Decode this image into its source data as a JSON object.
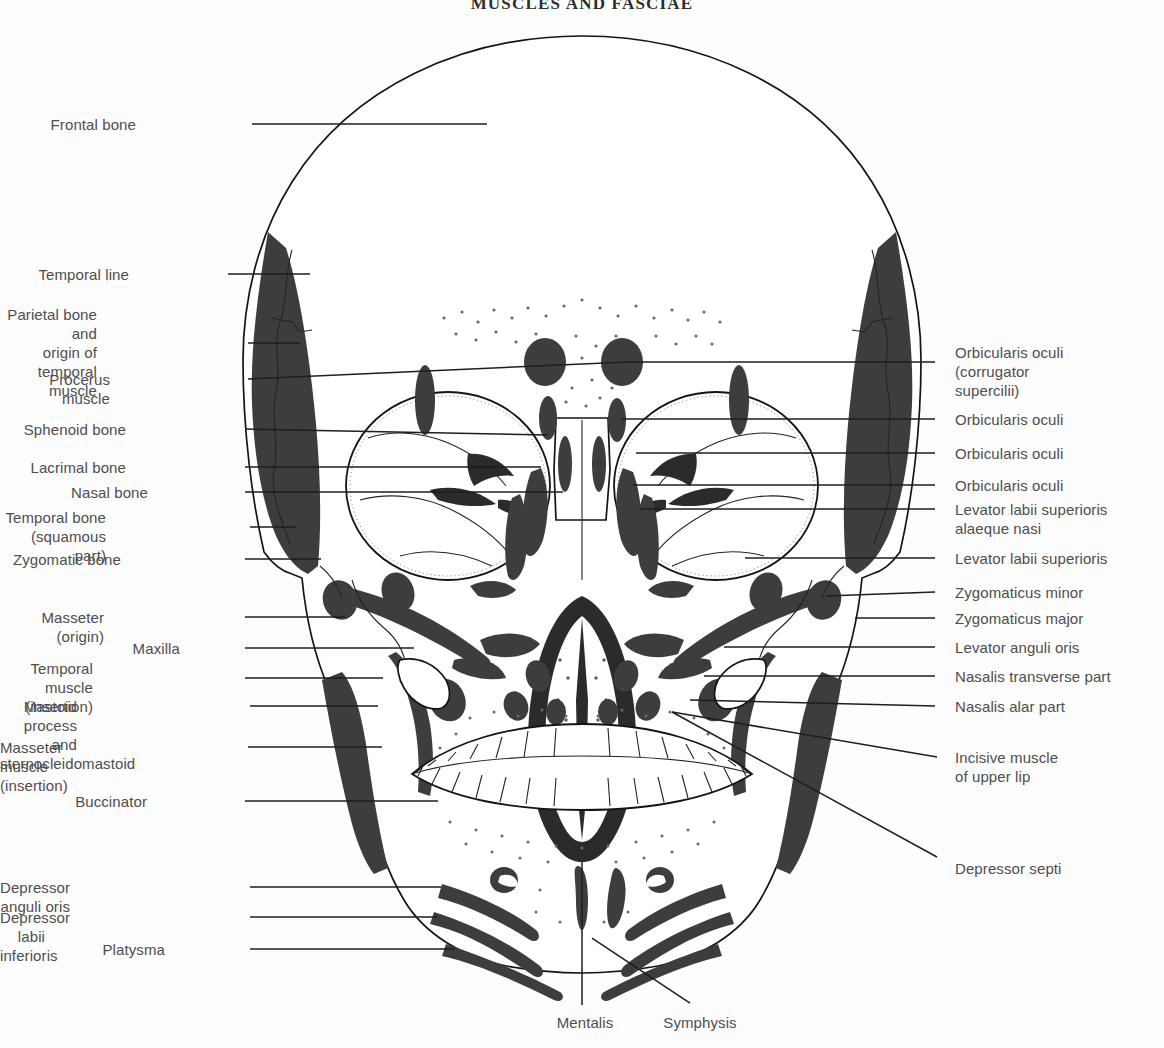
{
  "title": "MUSCLES AND FASCIAE",
  "colors": {
    "background": "#fdfdfd",
    "muscle_fill": "#3d3d3d",
    "bone_outline": "#141414",
    "label_text": "#4d4d4d",
    "leader_line": "#1e1e1e"
  },
  "figure": {
    "name": "anterior-view-skull-with-facial-muscles",
    "view": "anterior"
  },
  "labels_left": [
    {
      "id": "frontal-bone",
      "text": "Frontal bone",
      "x": 136,
      "y": 115,
      "line_x1": 252,
      "line_y1": 124,
      "line_x2": 487,
      "line_y2": 124
    },
    {
      "id": "temporal-line",
      "text": "Temporal line",
      "x": 129,
      "y": 265,
      "line_x1": 228,
      "line_y1": 274,
      "line_x2": 310,
      "line_y2": 274
    },
    {
      "id": "parietal-bone-origin",
      "text": "Parietal bone and\norigin of temporal\nmuscle",
      "x": 97,
      "y": 305,
      "line_x1": 248,
      "line_y1": 343,
      "line_x2": 300,
      "line_y2": 343
    },
    {
      "id": "procerus-muscle",
      "text": "Procerus muscle",
      "x": 110,
      "y": 370,
      "line_x1": 248,
      "line_y1": 379,
      "line_x2": 628,
      "line_y2": 362
    },
    {
      "id": "sphenoid-bone",
      "text": "Sphenoid bone",
      "x": 126,
      "y": 420,
      "line_x1": 245,
      "line_y1": 429,
      "line_x2": 548,
      "line_y2": 435
    },
    {
      "id": "lacrimal-bone",
      "text": "Lacrimal bone",
      "x": 126,
      "y": 458,
      "line_x1": 245,
      "line_y1": 467,
      "line_x2": 541,
      "line_y2": 467
    },
    {
      "id": "nasal-bone",
      "text": "Nasal bone",
      "x": 148,
      "y": 483,
      "line_x1": 245,
      "line_y1": 492,
      "line_x2": 563,
      "line_y2": 492
    },
    {
      "id": "temporal-bone-squamous",
      "text": "Temporal bone\n(squamous part)",
      "x": 106,
      "y": 508,
      "line_x1": 250,
      "line_y1": 527,
      "line_x2": 296,
      "line_y2": 527
    },
    {
      "id": "zygomatic-bone",
      "text": "Zygomatic bone",
      "x": 121,
      "y": 550,
      "line_x1": 245,
      "line_y1": 559,
      "line_x2": 321,
      "line_y2": 559
    },
    {
      "id": "masseter-origin",
      "text": "Masseter (origin)",
      "x": 104,
      "y": 608,
      "line_x1": 245,
      "line_y1": 617,
      "line_x2": 345,
      "line_y2": 617
    },
    {
      "id": "maxilla",
      "text": "Maxilla",
      "x": 180,
      "y": 639,
      "line_x1": 245,
      "line_y1": 648,
      "line_x2": 414,
      "line_y2": 648
    },
    {
      "id": "temporal-muscle-insertion",
      "text": "Temporal muscle\n(insertion)",
      "x": 93,
      "y": 659,
      "line_x1": 245,
      "line_y1": 678,
      "line_x2": 383,
      "line_y2": 678
    },
    {
      "id": "mastoid-process-scm",
      "text": "Mastoid process and\nsternocleidomastoid",
      "x": 77,
      "y": 697,
      "line_x1": 250,
      "line_y1": 706,
      "line_x2": 378,
      "line_y2": 706
    },
    {
      "id": "masseter-muscle-insertion",
      "text": "Masseter muscle (insertion)",
      "x": 16,
      "y": 738,
      "line_x1": 248,
      "line_y1": 747,
      "line_x2": 382,
      "line_y2": 747
    },
    {
      "id": "buccinator",
      "text": "Buccinator",
      "x": 147,
      "y": 792,
      "line_x1": 245,
      "line_y1": 801,
      "line_x2": 438,
      "line_y2": 801
    },
    {
      "id": "depressor-anguli-oris",
      "text": "Depressor anguli oris",
      "x": 70,
      "y": 878,
      "line_x1": 250,
      "line_y1": 887,
      "line_x2": 441,
      "line_y2": 887
    },
    {
      "id": "depressor-labii-inferioris",
      "text": "Depressor labii inferioris",
      "x": 45,
      "y": 908,
      "line_x1": 250,
      "line_y1": 917,
      "line_x2": 437,
      "line_y2": 917
    },
    {
      "id": "platysma",
      "text": "Platysma",
      "x": 165,
      "y": 940,
      "line_x1": 250,
      "line_y1": 949,
      "line_x2": 455,
      "line_y2": 949
    }
  ],
  "labels_right": [
    {
      "id": "orbicularis-oculi-corrugator",
      "text": "Orbicularis oculi\n (corrugator\nsupercilii)",
      "x": 955,
      "y": 343,
      "line_x1": 935,
      "line_y1": 362,
      "line_x2": 628,
      "line_y2": 362
    },
    {
      "id": "orbicularis-oculi-1",
      "text": "Orbicularis oculi",
      "x": 955,
      "y": 410,
      "line_x1": 935,
      "line_y1": 419,
      "line_x2": 622,
      "line_y2": 419
    },
    {
      "id": "orbicularis-oculi-2",
      "text": "Orbicularis oculi",
      "x": 955,
      "y": 444,
      "line_x1": 935,
      "line_y1": 453,
      "line_x2": 636,
      "line_y2": 453
    },
    {
      "id": "orbicularis-oculi-3",
      "text": "Orbicularis oculi",
      "x": 955,
      "y": 476,
      "line_x1": 935,
      "line_y1": 485,
      "line_x2": 633,
      "line_y2": 485
    },
    {
      "id": "levator-labii-sup-alaeque",
      "text": "Levator labii superioris\nalaeque nasi",
      "x": 955,
      "y": 500,
      "line_x1": 935,
      "line_y1": 509,
      "line_x2": 640,
      "line_y2": 509
    },
    {
      "id": "levator-labii-superioris",
      "text": "Levator labii superioris",
      "x": 955,
      "y": 549,
      "line_x1": 935,
      "line_y1": 558,
      "line_x2": 745,
      "line_y2": 558
    },
    {
      "id": "zygomaticus-minor",
      "text": "Zygomaticus minor",
      "x": 955,
      "y": 583,
      "line_x1": 935,
      "line_y1": 592,
      "line_x2": 826,
      "line_y2": 596
    },
    {
      "id": "zygomaticus-major",
      "text": "Zygomaticus major",
      "x": 955,
      "y": 609,
      "line_x1": 935,
      "line_y1": 618,
      "line_x2": 855,
      "line_y2": 618
    },
    {
      "id": "levator-anguli-oris",
      "text": "Levator anguli oris",
      "x": 955,
      "y": 638,
      "line_x1": 935,
      "line_y1": 647,
      "line_x2": 724,
      "line_y2": 647
    },
    {
      "id": "nasalis-transverse-part",
      "text": "Nasalis transverse part",
      "x": 955,
      "y": 667,
      "line_x1": 935,
      "line_y1": 676,
      "line_x2": 704,
      "line_y2": 676
    },
    {
      "id": "nasalis-alar-part",
      "text": "Nasalis alar part",
      "x": 955,
      "y": 697,
      "line_x1": 935,
      "line_y1": 706,
      "line_x2": 690,
      "line_y2": 700
    },
    {
      "id": "incisive-muscle-upper-lip",
      "text": "Incisive muscle\nof upper lip",
      "x": 955,
      "y": 748,
      "line_x1": 937,
      "line_y1": 757,
      "line_x2": 672,
      "line_y2": 712
    },
    {
      "id": "depressor-septi",
      "text": "Depressor septi",
      "x": 955,
      "y": 859,
      "line_x1": 937,
      "line_y1": 857,
      "line_x2": 672,
      "line_y2": 712
    }
  ],
  "labels_bottom": [
    {
      "id": "mentalis",
      "text": "Mentalis",
      "x": 530,
      "y": 1013,
      "line_x1": 582,
      "line_y1": 1005,
      "line_x2": 582,
      "line_y2": 862
    },
    {
      "id": "symphysis",
      "text": "Symphysis",
      "x": 645,
      "y": 1013,
      "line_x1": 690,
      "line_y1": 1003,
      "line_x2": 592,
      "line_y2": 938
    }
  ]
}
